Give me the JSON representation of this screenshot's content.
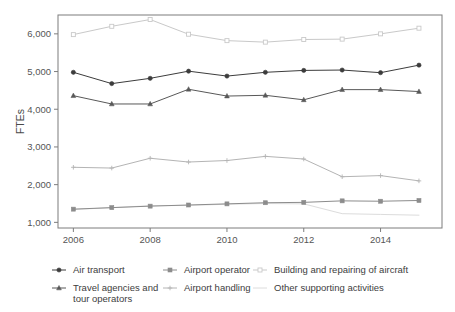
{
  "chart_data": {
    "type": "line",
    "title": "",
    "xlabel": "",
    "ylabel": "FTEs",
    "x": [
      2006,
      2007,
      2008,
      2009,
      2010,
      2011,
      2012,
      2013,
      2014,
      2015
    ],
    "x_tick_labels": [
      "2006",
      "2008",
      "2010",
      "2012",
      "2014"
    ],
    "x_ticks": [
      2006,
      2008,
      2010,
      2012,
      2014
    ],
    "y_tick_labels": [
      "1,000",
      "2,000",
      "3,000",
      "4,000",
      "5,000",
      "6,000"
    ],
    "y_ticks": [
      1000,
      2000,
      3000,
      4000,
      5000,
      6000
    ],
    "xlim": [
      2005.6,
      2015.6
    ],
    "ylim": [
      850,
      6500
    ],
    "grid": false,
    "legend_position": "bottom",
    "series": [
      {
        "name": "Air transport",
        "marker": "circle",
        "color": "#3c3c3c",
        "values": [
          4980,
          4680,
          4820,
          5010,
          4880,
          4980,
          5030,
          5040,
          4970,
          5170
        ]
      },
      {
        "name": "Travel agencies and tour operators",
        "marker": "triangle",
        "color": "#585858",
        "values": [
          4360,
          4140,
          4140,
          4530,
          4350,
          4370,
          4250,
          4520,
          4520,
          4470
        ]
      },
      {
        "name": "Airport operator",
        "marker": "square",
        "color": "#8c8c8c",
        "values": [
          1350,
          1390,
          1430,
          1460,
          1490,
          1520,
          1530,
          1570,
          1560,
          1580
        ]
      },
      {
        "name": "Airport handling",
        "marker": "plus",
        "color": "#b4b4b4",
        "values": [
          2460,
          2440,
          2700,
          2600,
          2640,
          2750,
          2680,
          2210,
          2240,
          2100
        ]
      },
      {
        "name": "Building and repairing of aircraft",
        "marker": "square-open",
        "color": "#c9c9c9",
        "values": [
          5980,
          6200,
          6380,
          5990,
          5820,
          5780,
          5850,
          5860,
          6000,
          6150
        ]
      },
      {
        "name": "Other supporting activities",
        "marker": "none",
        "color": "#dcdcdc",
        "values": [
          1340,
          1390,
          1440,
          1450,
          1480,
          1500,
          1490,
          1230,
          1210,
          1190
        ]
      }
    ]
  },
  "legend": {
    "items": [
      {
        "label": "Air transport",
        "marker": "circle",
        "color": "#3c3c3c"
      },
      {
        "label": "Airport operator",
        "marker": "square",
        "color": "#8c8c8c"
      },
      {
        "label": "Building and repairing of aircraft",
        "marker": "square-open",
        "color": "#c9c9c9"
      },
      {
        "label": "Travel agencies and tour operators",
        "marker": "triangle",
        "color": "#585858"
      },
      {
        "label": "Airport handling",
        "marker": "plus",
        "color": "#b4b4b4"
      },
      {
        "label": "Other supporting activities",
        "marker": "none",
        "color": "#dcdcdc"
      }
    ]
  },
  "axis": {
    "y_title": "FTEs"
  }
}
